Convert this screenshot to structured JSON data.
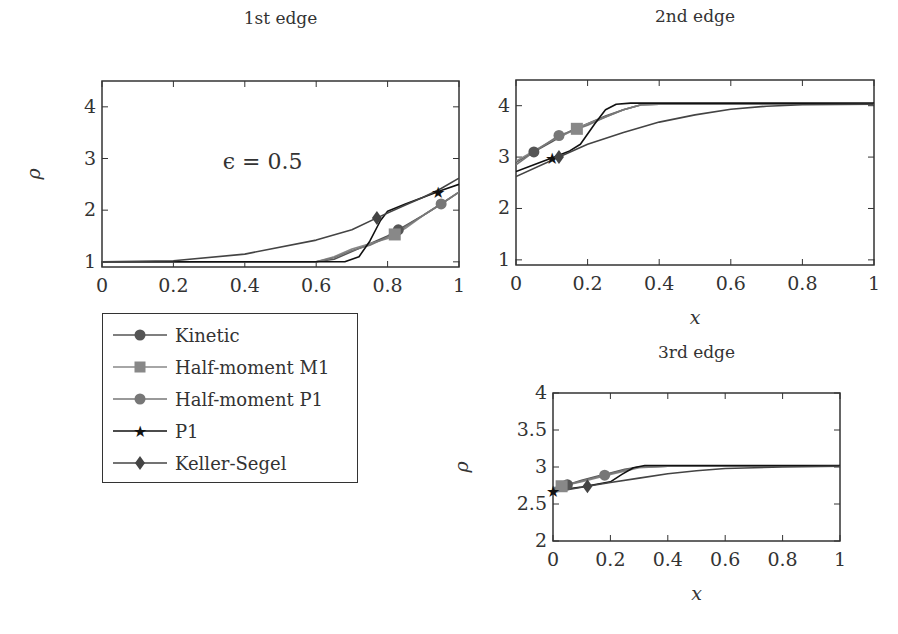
{
  "chart_data": [
    {
      "type": "line",
      "title": "1st edge",
      "xlabel": "",
      "ylabel": "ρ",
      "xlim": [
        0,
        1
      ],
      "ylim": [
        0.9,
        4.5
      ],
      "xticks": [
        "0",
        "0.2",
        "0.4",
        "0.6",
        "0.8",
        "1"
      ],
      "yticks": [
        "1",
        "2",
        "3",
        "4"
      ],
      "annotation": "ϵ = 0.5",
      "grid": false,
      "series": [
        {
          "name": "Kinetic",
          "x": [
            0,
            0.6,
            0.65,
            0.7,
            0.75,
            0.8,
            0.85,
            0.9,
            0.95,
            1.0
          ],
          "y": [
            1.0,
            1.0,
            1.05,
            1.2,
            1.35,
            1.5,
            1.7,
            1.9,
            2.12,
            2.35
          ],
          "marker": "circle",
          "color": "#555555"
        },
        {
          "name": "Half-moment M1",
          "x": [
            0,
            0.6,
            0.65,
            0.7,
            0.75,
            0.8,
            0.85,
            0.9,
            0.95,
            1.0
          ],
          "y": [
            1.0,
            1.0,
            1.1,
            1.25,
            1.35,
            1.45,
            1.65,
            1.9,
            2.12,
            2.35
          ],
          "marker": "square",
          "color": "#888888"
        },
        {
          "name": "Half-moment P1",
          "x": [
            0,
            0.6,
            0.65,
            0.7,
            0.75,
            0.8,
            0.85,
            0.9,
            0.95,
            1.0
          ],
          "y": [
            1.0,
            1.0,
            1.08,
            1.22,
            1.32,
            1.48,
            1.68,
            1.9,
            2.12,
            2.35
          ],
          "marker": "circle",
          "color": "#777777"
        },
        {
          "name": "P1",
          "x": [
            0,
            0.68,
            0.72,
            0.75,
            0.78,
            0.8,
            0.85,
            0.9,
            0.95,
            1.0
          ],
          "y": [
            1.0,
            1.0,
            1.1,
            1.4,
            1.8,
            1.98,
            2.12,
            2.25,
            2.38,
            2.5
          ],
          "marker": "star",
          "color": "#111111"
        },
        {
          "name": "Keller-Segel",
          "x": [
            0,
            0.2,
            0.4,
            0.6,
            0.7,
            0.77,
            0.85,
            0.9,
            0.95,
            1.0
          ],
          "y": [
            1.0,
            1.02,
            1.15,
            1.42,
            1.62,
            1.85,
            2.1,
            2.25,
            2.42,
            2.62
          ],
          "marker": "diamond",
          "color": "#444444"
        }
      ]
    },
    {
      "type": "line",
      "title": "2nd edge",
      "xlabel": "x",
      "ylabel": "",
      "xlim": [
        0,
        1
      ],
      "ylim": [
        0.9,
        4.5
      ],
      "xticks": [
        "0",
        "0.2",
        "0.4",
        "0.6",
        "0.8",
        "1"
      ],
      "yticks": [
        "1",
        "2",
        "3",
        "4"
      ],
      "grid": false,
      "series": [
        {
          "name": "Kinetic",
          "x": [
            0,
            0.05,
            0.1,
            0.15,
            0.2,
            0.25,
            0.3,
            0.35,
            0.4,
            1.0
          ],
          "y": [
            2.9,
            3.1,
            3.3,
            3.5,
            3.65,
            3.8,
            3.92,
            4.02,
            4.03,
            4.03
          ],
          "marker": "circle",
          "color": "#555555"
        },
        {
          "name": "Half-moment M1",
          "x": [
            0,
            0.05,
            0.1,
            0.17,
            0.2,
            0.25,
            0.3,
            0.35,
            0.4,
            1.0
          ],
          "y": [
            2.92,
            3.12,
            3.32,
            3.55,
            3.65,
            3.78,
            3.92,
            4.02,
            4.03,
            4.03
          ],
          "marker": "square",
          "color": "#888888"
        },
        {
          "name": "Half-moment P1",
          "x": [
            0,
            0.05,
            0.12,
            0.2,
            0.25,
            0.3,
            0.35,
            0.4,
            1.0
          ],
          "y": [
            2.85,
            3.1,
            3.42,
            3.62,
            3.78,
            3.92,
            4.02,
            4.03,
            4.03
          ],
          "marker": "circle",
          "color": "#777777"
        },
        {
          "name": "P1",
          "x": [
            0,
            0.05,
            0.1,
            0.15,
            0.18,
            0.22,
            0.25,
            0.28,
            0.32,
            1.0
          ],
          "y": [
            2.72,
            2.85,
            2.98,
            3.12,
            3.25,
            3.65,
            3.92,
            4.03,
            4.05,
            4.05
          ],
          "marker": "star",
          "color": "#111111"
        },
        {
          "name": "Keller-Segel",
          "x": [
            0,
            0.12,
            0.2,
            0.3,
            0.4,
            0.5,
            0.6,
            0.7,
            0.8,
            1.0
          ],
          "y": [
            2.62,
            3.0,
            3.25,
            3.48,
            3.68,
            3.82,
            3.93,
            3.99,
            4.02,
            4.03
          ],
          "marker": "diamond",
          "color": "#444444"
        }
      ]
    },
    {
      "type": "line",
      "title": "3rd edge",
      "xlabel": "x",
      "ylabel": "ρ",
      "xlim": [
        0,
        1
      ],
      "ylim": [
        2,
        4
      ],
      "xticks": [
        "0",
        "0.2",
        "0.4",
        "0.6",
        "0.8",
        "1"
      ],
      "yticks": [
        "2",
        "2.5",
        "3",
        "3.5",
        "4"
      ],
      "grid": false,
      "series": [
        {
          "name": "Kinetic",
          "x": [
            0,
            0.05,
            0.1,
            0.15,
            0.2,
            0.25,
            0.3,
            0.4,
            1.0
          ],
          "y": [
            2.7,
            2.76,
            2.82,
            2.87,
            2.92,
            2.97,
            3.0,
            3.01,
            3.01
          ],
          "marker": "circle",
          "color": "#555555"
        },
        {
          "name": "Half-moment M1",
          "x": [
            0,
            0.03,
            0.1,
            0.2,
            0.3,
            0.4,
            1.0
          ],
          "y": [
            2.72,
            2.74,
            2.8,
            2.9,
            2.99,
            3.01,
            3.01
          ],
          "marker": "square",
          "color": "#888888"
        },
        {
          "name": "Half-moment P1",
          "x": [
            0,
            0.05,
            0.12,
            0.18,
            0.25,
            0.3,
            0.4,
            1.0
          ],
          "y": [
            2.7,
            2.76,
            2.83,
            2.89,
            2.96,
            3.0,
            3.01,
            3.01
          ],
          "marker": "circle",
          "color": "#777777"
        },
        {
          "name": "P1",
          "x": [
            0,
            0.1,
            0.2,
            0.24,
            0.28,
            0.32,
            1.0
          ],
          "y": [
            2.68,
            2.73,
            2.8,
            2.9,
            2.99,
            3.02,
            3.02
          ],
          "marker": "star",
          "color": "#111111"
        },
        {
          "name": "Keller-Segel",
          "x": [
            0,
            0.12,
            0.2,
            0.3,
            0.4,
            0.5,
            0.6,
            0.8,
            1.0
          ],
          "y": [
            2.66,
            2.74,
            2.79,
            2.85,
            2.91,
            2.95,
            2.98,
            3.0,
            3.01
          ],
          "marker": "diamond",
          "color": "#444444"
        }
      ]
    }
  ],
  "legend": {
    "entries": [
      {
        "label": "Kinetic",
        "marker": "circle",
        "color": "#555555"
      },
      {
        "label": "Half-moment M1",
        "marker": "square",
        "color": "#888888"
      },
      {
        "label": "Half-moment P1",
        "marker": "circle",
        "color": "#777777"
      },
      {
        "label": "P1",
        "marker": "star",
        "color": "#111111"
      },
      {
        "label": "Keller-Segel",
        "marker": "diamond",
        "color": "#444444"
      }
    ]
  },
  "markers_at": [
    [
      [
        0.83,
        "Kinetic"
      ],
      [
        0.82,
        "Half-moment M1"
      ],
      [
        0.95,
        "Half-moment P1"
      ],
      [
        0.94,
        "P1"
      ],
      [
        0.77,
        "Keller-Segel"
      ]
    ],
    [
      [
        0.05,
        "Kinetic"
      ],
      [
        0.17,
        "Half-moment M1"
      ],
      [
        0.12,
        "Half-moment P1"
      ],
      [
        0.1,
        "P1"
      ],
      [
        0.12,
        "Keller-Segel"
      ]
    ],
    [
      [
        0.05,
        "Kinetic"
      ],
      [
        0.03,
        "Half-moment M1"
      ],
      [
        0.18,
        "Half-moment P1"
      ],
      [
        0.0,
        "P1"
      ],
      [
        0.12,
        "Keller-Segel"
      ]
    ]
  ]
}
